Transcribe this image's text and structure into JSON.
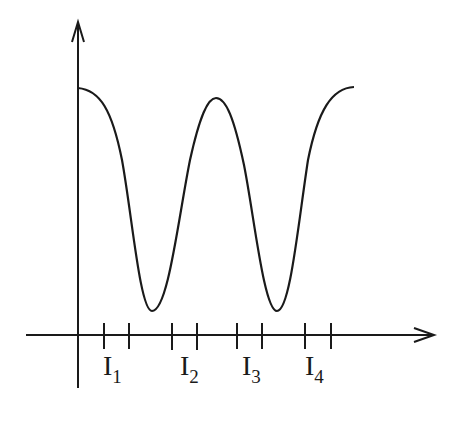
{
  "diagram": {
    "type": "periodic intensity curve",
    "colors": {
      "ink": "#1a1a1a",
      "background": "#ffffff"
    },
    "axes": {
      "x_arrow": true,
      "y_arrow": true
    },
    "interval_labels": [
      {
        "main": "I",
        "sub": "1"
      },
      {
        "main": "I",
        "sub": "2"
      },
      {
        "main": "I",
        "sub": "3"
      },
      {
        "main": "I",
        "sub": "4"
      }
    ],
    "curve": {
      "maxima_count": 3,
      "minima_count": 2
    },
    "tick_count": 8
  }
}
